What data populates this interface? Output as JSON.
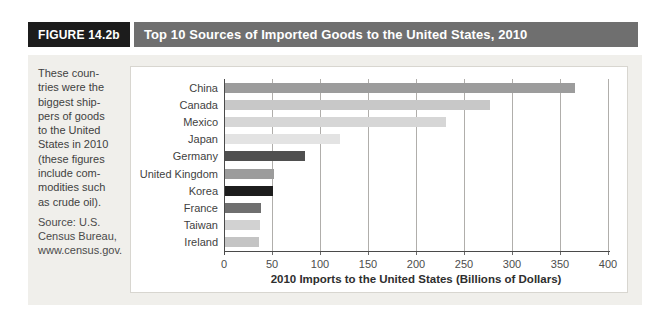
{
  "figure": {
    "label": "FIGURE 14.2b",
    "title": "Top 10 Sources of Imported Goods to the United States, 2010"
  },
  "sidebar": {
    "caption": "These coun-\ntries were the\nbiggest ship-\npers of goods\nto the United\nStates in 2010\n(these figures\ninclude com-\nmodities such\nas crude oil).",
    "source": "Source: U.S.\nCensus Bureau,\nwww.census.gov."
  },
  "chart_data": {
    "type": "bar",
    "orientation": "horizontal",
    "title": "Top 10 Sources of Imported Goods to the United States, 2010",
    "categories": [
      "China",
      "Canada",
      "Mexico",
      "Japan",
      "Germany",
      "United Kingdom",
      "Korea",
      "France",
      "Taiwan",
      "Ireland"
    ],
    "values": [
      365,
      276,
      230,
      120,
      83,
      51,
      50,
      38,
      36,
      35
    ],
    "bar_colors": [
      "#9c9c9c",
      "#c8c8c8",
      "#d6d6d6",
      "#e3e3e3",
      "#4f4f4f",
      "#9c9c9c",
      "#1d1d1d",
      "#6f6f6f",
      "#d2d2d2",
      "#c4c4c4"
    ],
    "xlabel": "2010 Imports to the United States (Billions of Dollars)",
    "ylabel": "",
    "xlim": [
      0,
      400
    ],
    "xticks": [
      0,
      50,
      100,
      150,
      200,
      250,
      300,
      350,
      400
    ],
    "grid": true,
    "legend": "none"
  },
  "colors": {
    "figure_label_bg": "#1c1c1c",
    "header_bar_bg": "#6f6f6f",
    "panel_bg": "#f0efeb",
    "chart_bg": "#ffffff",
    "gridline": "#b0aeab",
    "axis": "#4a4a4a",
    "text": "#3f3f3f"
  }
}
